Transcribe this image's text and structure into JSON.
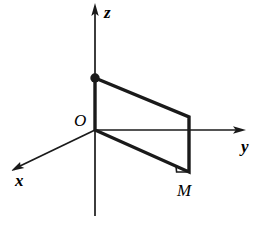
{
  "figure": {
    "type": "geometry-diagram",
    "canvas": {
      "width": 261,
      "height": 234,
      "background": "#ffffff"
    },
    "stroke_color": "#1a1a1a",
    "axes": [
      {
        "id": "z",
        "label": "z",
        "label_x": 104,
        "label_y": 4,
        "from_x": 95,
        "from_y": 216,
        "to_x": 95,
        "to_y": 8,
        "arrow": true,
        "width": 1.6
      },
      {
        "id": "y",
        "label": "y",
        "label_x": 241,
        "label_y": 138,
        "from_x": 95,
        "from_y": 130,
        "to_x": 241,
        "to_y": 130,
        "arrow": true,
        "width": 1.6
      },
      {
        "id": "x",
        "label": "x",
        "label_x": 15,
        "label_y": 172,
        "from_x": 95,
        "from_y": 130,
        "to_x": 16,
        "to_y": 168,
        "arrow": true,
        "width": 1.6
      }
    ],
    "origin": {
      "label": "O",
      "x": 95,
      "y": 130,
      "label_x": 74,
      "label_y": 112
    },
    "points": [
      {
        "id": "z-projection-point",
        "label": "",
        "x": 95,
        "y": 78,
        "dot": true,
        "dot_radius": 4.6
      },
      {
        "id": "M",
        "label": "M",
        "x": 189,
        "y": 172,
        "dot": false,
        "label_x": 177,
        "label_y": 182
      }
    ],
    "rectangle": {
      "id": "projection-rectangle",
      "stroke_width": 3.4,
      "vertices": [
        {
          "x": 95,
          "y": 78
        },
        {
          "x": 189,
          "y": 117
        },
        {
          "x": 189,
          "y": 172
        },
        {
          "x": 95,
          "y": 130
        }
      ]
    },
    "right_angle_marker": {
      "id": "right-angle-at-M",
      "corner_x": 189,
      "corner_y": 172,
      "size": 13,
      "stroke_width": 1.5
    }
  }
}
